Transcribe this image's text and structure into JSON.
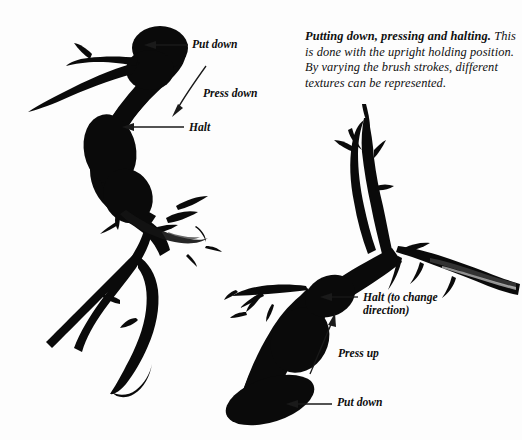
{
  "page": {
    "background_color": "#fdfdfd",
    "ink_color": "#0a0a0a",
    "width": 522,
    "height": 440
  },
  "caption": {
    "heading": "Putting down, pressing and halting.",
    "body": "This is done with the upright holding position. By varying the brush strokes, different textures can be represented."
  },
  "annotations": {
    "put_down_top": "Put down",
    "press_down": "Press down",
    "halt": "Halt",
    "halt_change_direction": "Halt (to change\ndirection)",
    "press_up": "Press up",
    "put_down_bottom": "Put down"
  },
  "figures": {
    "upper_left_stroke": "thick S-curved ink brush stroke with bulbous head, tapering tail and descending branch",
    "lower_right_stroke": "thick diagonal ink brush stroke with branching arms and dry-brush texture"
  }
}
